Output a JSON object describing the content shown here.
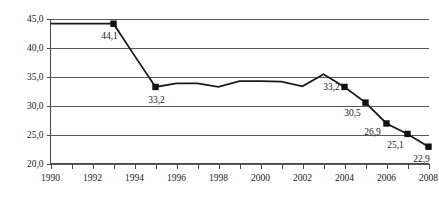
{
  "chart_data": {
    "type": "line",
    "title": "",
    "xlabel": "",
    "ylabel": "",
    "xlim": [
      1990,
      2008
    ],
    "ylim": [
      20.0,
      45.0
    ],
    "grid": true,
    "legend": "none",
    "y_ticks": [
      "45,0",
      "40,0",
      "35,0",
      "30,0",
      "25,0",
      "20,0"
    ],
    "y_tick_values": [
      45.0,
      40.0,
      35.0,
      30.0,
      25.0,
      20.0
    ],
    "x_ticks": [
      "1990",
      "1992",
      "1994",
      "1996",
      "1998",
      "2000",
      "2002",
      "2004",
      "2006",
      "2008"
    ],
    "x_tick_values": [
      1990,
      1992,
      1994,
      1996,
      1998,
      2000,
      2002,
      2004,
      2006,
      2008
    ],
    "x_minor_ticks": [
      1991,
      1993,
      1995,
      1997,
      1999,
      2001,
      2003,
      2005,
      2007
    ],
    "series": [
      {
        "name": "series-1",
        "x": [
          1990,
          1991,
          1992,
          1993,
          1994,
          1995,
          1996,
          1997,
          1998,
          1999,
          2000,
          2001,
          2002,
          2003,
          2004,
          2005,
          2006,
          2007,
          2008
        ],
        "values": [
          44.1,
          44.1,
          44.1,
          44.1,
          38.6,
          33.2,
          33.8,
          33.8,
          33.2,
          34.2,
          34.2,
          34.1,
          33.3,
          35.4,
          33.2,
          30.5,
          26.9,
          25.1,
          22.9
        ]
      }
    ],
    "markers": [
      {
        "x": 1993,
        "y": 44.1,
        "label": "44,1",
        "label_dx": -4,
        "label_dy": 15
      },
      {
        "x": 1995,
        "y": 33.2,
        "label": "33,2",
        "label_dx": 1,
        "label_dy": 16
      },
      {
        "x": 2004,
        "y": 33.2,
        "label": "33,2",
        "label_dx": -13,
        "label_dy": 3
      },
      {
        "x": 2005,
        "y": 30.5,
        "label": "30,5",
        "label_dx": -13,
        "label_dy": 13
      },
      {
        "x": 2006,
        "y": 26.9,
        "label": "26,9",
        "label_dx": -14,
        "label_dy": 12
      },
      {
        "x": 2007,
        "y": 25.1,
        "label": "25,1",
        "label_dx": -12,
        "label_dy": 14
      },
      {
        "x": 2008,
        "y": 22.9,
        "label": "22,9",
        "label_dx": -7,
        "label_dy": 15
      }
    ],
    "colors": {
      "line": "#1a1a1a",
      "marker": "#111111",
      "grid": "#595959",
      "axis": "#4a4a4a",
      "background": "#ffffff",
      "text": "#1a1a1a"
    }
  }
}
